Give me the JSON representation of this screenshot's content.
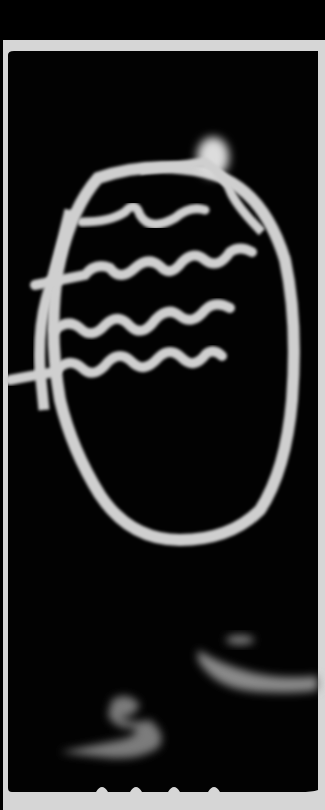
{
  "image": {
    "type": "photogram",
    "description": "Black photographic print with light-drawn white lines: a large oval loop with a bright glowing blob at its top, four horizontal wavy lines inside crossing a vertical stroke on the left, and soft smudged shapes near the bottom. A pale paper border frames the print.",
    "colors": {
      "background": "#000000",
      "paper_border": "#d8d8d8",
      "light_trace": "#cfcfcf",
      "soft_glow": "#8a8a8a"
    },
    "elements": [
      {
        "name": "outer-paper-top-margin",
        "label": "black area above print"
      },
      {
        "name": "print-frame",
        "label": "white paper border"
      },
      {
        "name": "oval-loop",
        "label": "large oval light trace"
      },
      {
        "name": "glow-blob",
        "label": "bright flame-like blob at top"
      },
      {
        "name": "wavy-line-1",
        "label": "top wavy line"
      },
      {
        "name": "wavy-line-2",
        "label": "second wavy line"
      },
      {
        "name": "wavy-line-3",
        "label": "third wavy line"
      },
      {
        "name": "wavy-line-4",
        "label": "fourth wavy line"
      },
      {
        "name": "vertical-stroke",
        "label": "left vertical stroke crossing waves"
      },
      {
        "name": "lower-smudge-right",
        "label": "soft streak at lower right"
      },
      {
        "name": "lower-smudge-left",
        "label": "soft curled shape at bottom"
      }
    ]
  }
}
